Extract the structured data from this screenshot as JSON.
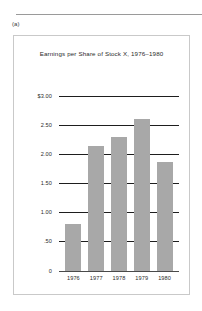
{
  "figure": {
    "label": "(a)"
  },
  "chart_data": {
    "type": "bar",
    "title": "Earnings per Share of Stock X, 1976–1980",
    "xlabel": "",
    "ylabel": "",
    "categories": [
      "1976",
      "1977",
      "1978",
      "1979",
      "1980"
    ],
    "values": [
      0.8,
      2.15,
      2.3,
      2.6,
      1.87
    ],
    "ylim": [
      0,
      3.0
    ],
    "ytick_values": [
      0,
      0.5,
      1.0,
      1.5,
      2.0,
      2.5,
      3.0
    ],
    "ytick_labels": [
      "0",
      ".50",
      "1.00",
      "1.50",
      "2.00",
      "2.50",
      "$3.00"
    ],
    "grid": true,
    "legend": null,
    "bar_color": "#a8a8a8",
    "gridline_color": "#1e1e1e",
    "axis_color": "#4a4a4a",
    "text_color": "#2b2b2b"
  }
}
